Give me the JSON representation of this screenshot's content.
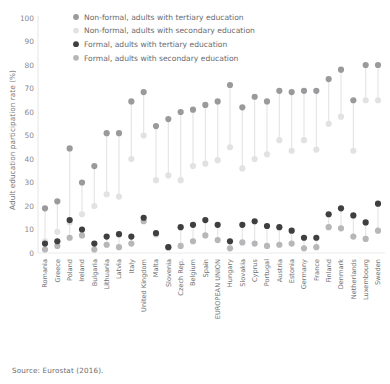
{
  "source_note": "Source: Eurostat (2016).",
  "axis": {
    "ylabel": "Adult education participation rate (%)",
    "yticks": [
      "0",
      "10",
      "20",
      "30",
      "40",
      "50",
      "60",
      "70",
      "80",
      "90",
      "100"
    ]
  },
  "legend": {
    "items": [
      {
        "label": "Non-formal, adults with tertiary education",
        "color": "#9a9a9d"
      },
      {
        "label": "Non-formal, adults with secondary education",
        "color": "#e2e2e3"
      },
      {
        "label": "Formal, adults with tertiary education",
        "color": "#3f3f42"
      },
      {
        "label": "Formal, adults with secondary education",
        "color": "#b7b7ba"
      }
    ]
  },
  "chart_data": {
    "type": "scatter",
    "title": "",
    "subtitle": "",
    "xlabel": "",
    "ylabel": "Adult education participation rate (%)",
    "ylim": [
      0,
      100
    ],
    "ytick_step": 10,
    "grid": false,
    "legend_position": "top-left",
    "categories": [
      "Romania",
      "Greece",
      "Poland",
      "Ireland",
      "Bulgaria",
      "Lithuania",
      "Latvia",
      "Italy",
      "United Kingdom",
      "Malta",
      "Slovenia",
      "Czech Rep.",
      "Belgium",
      "Spain",
      "EUROPEAN UNION",
      "Hungary",
      "Slovakia",
      "Cyprus",
      "Portugal",
      "Austria",
      "Estonia",
      "Germany",
      "France",
      "Finland",
      "Denmark",
      "Netherlands",
      "Luxembourg",
      "Sweden"
    ],
    "series": [
      {
        "name": "Non-formal, adults with tertiary education",
        "color": "#9a9a9d",
        "values": [
          19,
          22,
          44.5,
          30,
          37,
          51,
          51,
          64.5,
          68.5,
          54,
          57,
          60,
          61,
          63,
          64.5,
          71.5,
          62,
          66.5,
          64.5,
          69,
          68.5,
          69,
          69,
          74,
          78,
          65,
          80,
          80
        ]
      },
      {
        "name": "Non-formal, adults with secondary education",
        "color": "#e2e2e3",
        "values": [
          5,
          9,
          13,
          16.5,
          20,
          25,
          24,
          40,
          50,
          31,
          33,
          31,
          37,
          38,
          39.5,
          45,
          36,
          40,
          42,
          48,
          43.5,
          48,
          44,
          55,
          58,
          43.5,
          65,
          65
        ]
      },
      {
        "name": "Formal, adults with tertiary education",
        "color": "#3f3f42",
        "values": [
          4,
          5,
          14,
          10,
          4,
          7,
          8,
          7,
          15,
          8.5,
          2.5,
          11,
          12,
          14,
          12,
          5,
          12,
          13.5,
          11.5,
          11,
          9.5,
          6.5,
          6.5,
          16.5,
          19,
          16,
          13,
          21
        ]
      },
      {
        "name": "Formal, adults with secondary education",
        "color": "#b7b7ba",
        "values": [
          1.5,
          3,
          6.5,
          7.5,
          1.5,
          3.5,
          2.5,
          4,
          13.5,
          8,
          2.5,
          3,
          5,
          7.5,
          5.5,
          2,
          4.5,
          4,
          3,
          3.5,
          4,
          2,
          2.5,
          11,
          10.5,
          7,
          6,
          9.5
        ]
      }
    ]
  }
}
